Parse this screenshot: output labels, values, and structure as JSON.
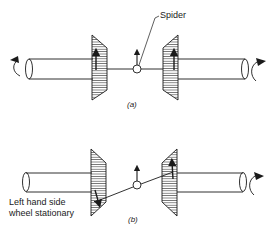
{
  "diagram": {
    "colors": {
      "ink": "#1a1a1a",
      "background": "#ffffff"
    },
    "labels": {
      "spider": "Spider",
      "caption_a": "(a)",
      "caption_b": "(b)",
      "stationary_line1": "Left hand side",
      "stationary_line2": "wheel stationary"
    },
    "panels": [
      {
        "id": "a",
        "description": "Both half-shafts rotating at equal speed; spider pinion moves straight with both side gears",
        "elements": [
          "left half-shaft with rotation arrow",
          "left bevel side gear with up arrow",
          "spider pinion with up arrow",
          "right bevel side gear with up arrow",
          "right half-shaft with rotation arrow"
        ]
      },
      {
        "id": "b",
        "description": "Left wheel stationary; spider pivots, right side gear turns at double speed",
        "elements": [
          "left half-shaft (no rotation)",
          "left bevel side gear with down arrow",
          "spider pinion with up arrow on tilted link",
          "right bevel side gear with up arrow",
          "right half-shaft with rotation arrow"
        ]
      }
    ]
  }
}
